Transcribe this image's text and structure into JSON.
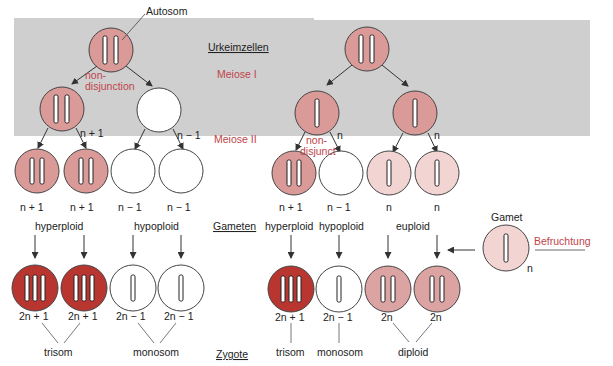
{
  "title_labels": {
    "autosom": "Autosom",
    "urkeimzellen": "Urkeimzellen",
    "meiose1": "Meiose I",
    "meiose2": "Meiose II",
    "gameten": "Gameten",
    "zygote": "Zygote",
    "gamet": "Gamet",
    "befruchtung": "Befruchtung"
  },
  "left_branch": {
    "nondisjunction_line1": "non-",
    "nondisjunction_line2": "disjunction",
    "meiose1_labels": [
      "n + 1",
      "n − 1"
    ],
    "gamete_labels": [
      "n + 1",
      "n + 1",
      "n − 1",
      "n − 1"
    ],
    "gamete_groups": [
      "hyperploid",
      "hypoploid"
    ],
    "zygote_labels": [
      "2n + 1",
      "2n + 1",
      "2n − 1",
      "2n − 1"
    ],
    "zygote_groups": [
      "trisom",
      "monosom"
    ]
  },
  "right_branch": {
    "nondisjunction_line1": "non-",
    "nondisjunction_line2": "disjunct",
    "meiose1_labels": [
      "n",
      "n"
    ],
    "gamete_labels": [
      "n + 1",
      "n − 1",
      "n",
      "n"
    ],
    "gamete_groups": [
      "hyperploid",
      "hypoploid",
      "euploid"
    ],
    "zygote_labels": [
      "2n + 1",
      "2n − 1",
      "2n",
      "2n"
    ],
    "zygote_groups": [
      "trisom",
      "monosom",
      "diploid"
    ],
    "gamet_label": "n"
  },
  "colors": {
    "gray_band": "#cfcfcf",
    "cell_medium": "#d99a98",
    "cell_light": "#f2d4d3",
    "cell_dark": "#b83530",
    "accent_red": "#c0444a"
  }
}
